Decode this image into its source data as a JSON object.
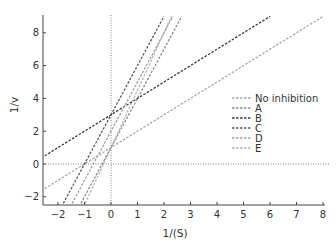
{
  "chart_data": {
    "type": "line",
    "title": "",
    "xlabel": "1/(S)",
    "ylabel": "1/v",
    "xlim": [
      -2.5,
      8
    ],
    "ylim": [
      -2.4,
      9
    ],
    "x_ticks": [
      -2,
      -1,
      0,
      1,
      2,
      3,
      4,
      5,
      6,
      7,
      8
    ],
    "y_ticks": [
      -2,
      0,
      2,
      4,
      6,
      8
    ],
    "grid": false,
    "reference_lines": [
      {
        "orientation": "vertical",
        "value": 0,
        "style": "dotted"
      },
      {
        "orientation": "horizontal",
        "value": 0,
        "style": "dotted"
      }
    ],
    "legend_position": "right-middle",
    "series": [
      {
        "name": "No inhibition",
        "slope": 1.0,
        "intercept": 1.0,
        "color": "#a8a8a8",
        "style": "dashed"
      },
      {
        "name": "A",
        "slope": 3.0,
        "intercept": 1.0,
        "color": "#8c8c8c",
        "style": "dashed"
      },
      {
        "name": "B",
        "slope": 1.0,
        "intercept": 3.0,
        "color": "#3a3a3a",
        "style": "dashed"
      },
      {
        "name": "C",
        "slope": 3.0,
        "intercept": 3.0,
        "color": "#5a5a5a",
        "style": "dashed"
      },
      {
        "name": "D",
        "slope": 3.0,
        "intercept": 2.0,
        "color": "#a0a0a0",
        "style": "dashed"
      },
      {
        "name": "E",
        "slope": 3.5,
        "intercept": 1.0,
        "color": "#b4b4b4",
        "style": "dashed"
      }
    ]
  }
}
